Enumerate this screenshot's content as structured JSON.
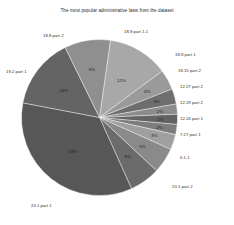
{
  "chart_data": {
    "type": "pie",
    "title": "The most popular administrative laws from the dataset",
    "xlabel": "",
    "ylabel": "",
    "legend_position": "outside-perimeter",
    "grid": false,
    "categories": [
      "18.8 part 1.1",
      "18.8 part 1",
      "18.15 part 2",
      "12.27 part 2",
      "12.29 part 2",
      "12.24 part 1",
      "7.27 part 1",
      "6.1.1",
      "20.1 part 2",
      "20.1 part 1",
      "19.2 part 1",
      "18.8 part 2"
    ],
    "values": [
      12,
      4,
      3,
      2,
      2,
      2,
      3,
      5,
      6,
      33,
      14,
      9
    ],
    "value_labels": [
      "12%",
      "4%",
      "3%",
      "2%",
      "2%",
      "2%",
      "3%",
      "5%",
      "6%",
      "33%",
      "14%",
      "9%"
    ],
    "slice_colors": [
      "#a8a8a8",
      "#9a9a9a",
      "#6e6e6e",
      "#8c8c8c",
      "#636363",
      "#7d7d7d",
      "#9f9f9f",
      "#8a8a8a",
      "#6b6b6b",
      "#575757",
      "#646464",
      "#8f8f8f"
    ],
    "background_color": "#ffffff",
    "text_color": "#2f2f2f"
  }
}
